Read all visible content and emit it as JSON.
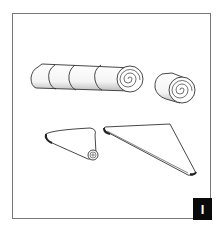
{
  "figure": {
    "step_badge": "I",
    "colors": {
      "frame": "#777777",
      "ink": "#333333",
      "badge_bg": "#0a0a0a",
      "badge_text": "#ffffff"
    },
    "drawings": [
      {
        "name": "long-roll-sliced",
        "segments": 4,
        "spiral_end": "right"
      },
      {
        "name": "short-roll",
        "spiral_end": "front"
      },
      {
        "name": "small-triangle-rolling",
        "spiral_corner": "bottom-right"
      },
      {
        "name": "large-triangle-flat"
      }
    ]
  }
}
